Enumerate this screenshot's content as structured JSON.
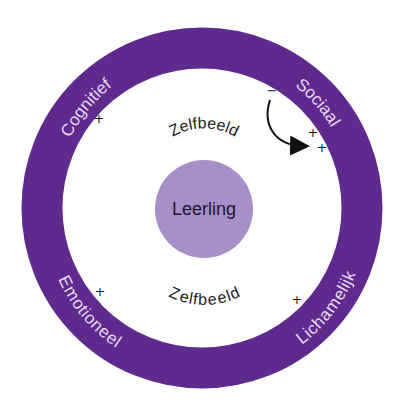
{
  "diagram": {
    "colors": {
      "ring": "#5f2a8e",
      "center": "#a88fc8",
      "ring_text": "#e6dcf0",
      "text": "#222222"
    },
    "center": {
      "label": "Leerling"
    },
    "self_image": {
      "top": "Zelfbeeld",
      "bottom": "Zelfbeeld"
    },
    "ring_segments": [
      {
        "id": "cognitief",
        "label": "Cognitief",
        "mark": "+"
      },
      {
        "id": "sociaal",
        "label": "Sociaal",
        "marks": [
          "−",
          "+",
          "+"
        ]
      },
      {
        "id": "emotioneel",
        "label": "Emotioneel",
        "mark": "+"
      },
      {
        "id": "lichamelijk",
        "label": "Lichamelijk",
        "mark": "+"
      }
    ],
    "arrow": {
      "from": "−",
      "to": "+ +",
      "segment": "Sociaal"
    }
  }
}
